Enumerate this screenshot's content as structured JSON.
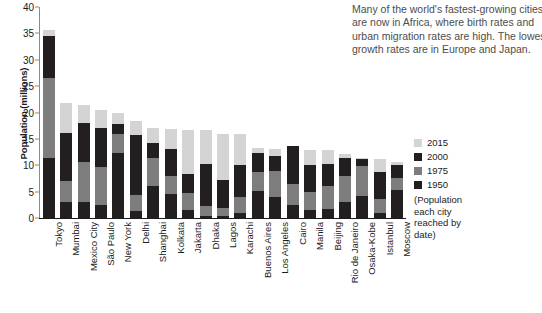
{
  "caption": {
    "lines": [
      "Many of the world's fastest-growing cities",
      "are now in Africa, where birth rates and",
      "urban migration rates are high. The lowest",
      "growth rates are in Europe and Japan."
    ]
  },
  "legend": {
    "items": [
      {
        "label": "2015",
        "color": "#d4d4d4"
      },
      {
        "label": "2000",
        "color": "#231f20"
      },
      {
        "label": "1975",
        "color": "#7d7d7d"
      },
      {
        "label": "1950",
        "color": "#231f20"
      }
    ],
    "note_lines": [
      "(Population",
      "each city",
      "reached by",
      "date)"
    ]
  },
  "chart_data": {
    "type": "bar",
    "subtype": "stacked",
    "title": "",
    "xlabel": "",
    "ylabel": "Population (millions)",
    "ylim": [
      0,
      40
    ],
    "yticks": [
      0,
      5,
      10,
      15,
      20,
      25,
      30,
      35,
      40
    ],
    "grid": false,
    "legend_position": "right",
    "categories": [
      "Tokyo",
      "Mumbai",
      "Mexico City",
      "São Paulo",
      "New York",
      "Delhi",
      "Shanghai",
      "Kolkata",
      "Jakarta",
      "Dhaka",
      "Lagos",
      "Karachi",
      "Buenos Aires",
      "Los Angeles",
      "Cairo",
      "Manila",
      "Beijing",
      "Rio de Janeiro",
      "Osaka-Kobe",
      "Istanbul",
      "Moscow"
    ],
    "series": [
      {
        "name": "1950",
        "color": "#231f20",
        "values": [
          11.3,
          3.0,
          3.1,
          2.4,
          12.3,
          1.4,
          6.1,
          4.5,
          1.5,
          0.3,
          0.3,
          1.0,
          5.1,
          4.0,
          2.5,
          1.5,
          1.7,
          3.0,
          4.1,
          1.0,
          5.4
        ]
      },
      {
        "name": "1975",
        "color": "#7d7d7d",
        "values": [
          26.6,
          7.1,
          10.7,
          9.6,
          15.9,
          4.4,
          11.4,
          7.9,
          4.8,
          2.2,
          1.9,
          4.0,
          8.7,
          8.9,
          6.4,
          5.0,
          6.0,
          7.9,
          9.8,
          3.6,
          7.6
        ]
      },
      {
        "name": "2000",
        "color": "#231f20",
        "values": [
          34.5,
          16.1,
          18.0,
          17.0,
          17.8,
          15.7,
          14.2,
          13.1,
          8.4,
          10.3,
          7.3,
          10.0,
          12.4,
          11.8,
          13.6,
          10.0,
          10.2,
          11.3,
          11.2,
          8.7,
          10.0
        ]
      },
      {
        "name": "2015",
        "color": "#d4d4d4",
        "values": [
          35.6,
          21.8,
          21.5,
          20.4,
          19.9,
          18.4,
          17.0,
          16.9,
          16.6,
          16.7,
          16.0,
          15.9,
          13.2,
          13.1,
          12.8,
          12.8,
          12.8,
          12.2,
          11.4,
          11.2,
          10.6
        ]
      }
    ],
    "note": "Stacked segments are cumulative population reached by each date; each bar's total equals the 2015 value."
  }
}
